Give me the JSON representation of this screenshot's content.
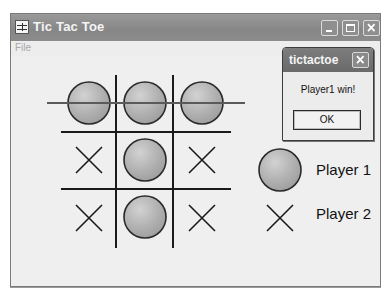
{
  "window": {
    "title": "Tic Tac Toe",
    "app_icon": "tictactoe-app-icon",
    "controls": [
      "minimize",
      "maximize",
      "close"
    ]
  },
  "menubar": {
    "items": [
      {
        "label": "File",
        "enabled": false
      }
    ]
  },
  "board": {
    "cells": [
      [
        "O",
        "O",
        "O"
      ],
      [
        "X",
        "O",
        "X"
      ],
      [
        "X",
        "O",
        "X"
      ]
    ],
    "winning_line": {
      "type": "row",
      "index": 0
    },
    "colors": {
      "grid": "#1a1a1a",
      "strike": "#5a5a5a",
      "o_fill": "#b4b4b4",
      "x_stroke": "#1a1a1a"
    }
  },
  "legend": {
    "player1": {
      "symbol": "O",
      "label": "Player 1"
    },
    "player2": {
      "symbol": "X",
      "label": "Player 2"
    }
  },
  "dialog": {
    "title": "tictactoe",
    "message": "Player1 win!",
    "ok_label": "OK"
  }
}
